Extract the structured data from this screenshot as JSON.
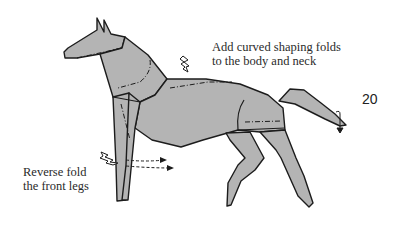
{
  "diagram": {
    "step_number": "20",
    "instructions": [
      {
        "id": "body-neck",
        "lines": [
          "Add curved shaping folds",
          "to the body and neck"
        ]
      },
      {
        "id": "front-legs",
        "lines": [
          "Reverse fold",
          "the front legs"
        ]
      }
    ],
    "colors": {
      "paper_fill": "#b4b4b4",
      "outline": "#1c1c1c",
      "text": "#2a2a2a",
      "background": "#ffffff"
    },
    "icons": [
      "push-arrow-icon",
      "reverse-fold-arrow-icon",
      "tail-fold-arrow-icon"
    ]
  }
}
